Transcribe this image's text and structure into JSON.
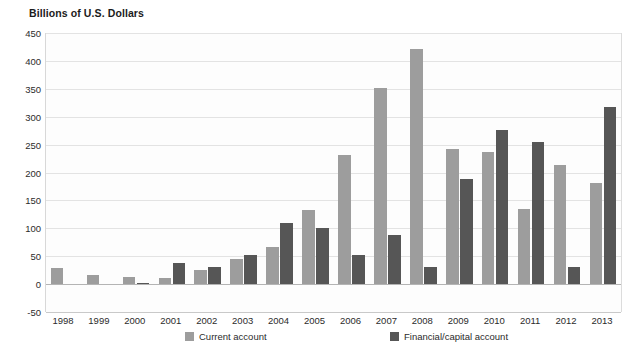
{
  "chart_data": {
    "type": "bar",
    "title": "Billions of U.S. Dollars",
    "xlabel": "",
    "ylabel": "",
    "ylim": [
      -50,
      450
    ],
    "ytick_step": 50,
    "yticks": [
      450,
      400,
      350,
      300,
      250,
      200,
      150,
      100,
      50,
      0,
      -50
    ],
    "ytick_labels": [
      "450",
      "400",
      "350",
      "300",
      "250",
      "200",
      "150",
      "100",
      "50",
      "0",
      "-50"
    ],
    "grid": true,
    "legend_position": "bottom",
    "categories": [
      "1998",
      "1999",
      "2000",
      "2001",
      "2002",
      "2003",
      "2004",
      "2005",
      "2006",
      "2007",
      "2008",
      "2009",
      "2010",
      "2011",
      "2012",
      "2013"
    ],
    "series": [
      {
        "name": "Current account",
        "color": "#9d9d9d",
        "values": [
          29,
          16,
          13,
          11,
          26,
          45,
          66,
          133,
          231,
          352,
          421,
          243,
          236,
          135,
          214,
          181
        ]
      },
      {
        "name": "Financial/capital account",
        "color": "#565656",
        "values": [
          0,
          0,
          2,
          38,
          31,
          52,
          110,
          100,
          52,
          88,
          30,
          188,
          277,
          254,
          30,
          318
        ]
      }
    ]
  },
  "legend": {
    "items": [
      {
        "label": "Current account",
        "swatch": "light"
      },
      {
        "label": "Financial/capital account",
        "swatch": "dark"
      }
    ]
  },
  "colors": {
    "current_account": "#9d9d9d",
    "financial_capital_account": "#565656",
    "gridline": "#e3e3e3",
    "axis_text": "#2b2b2b",
    "background": "#ffffff"
  }
}
